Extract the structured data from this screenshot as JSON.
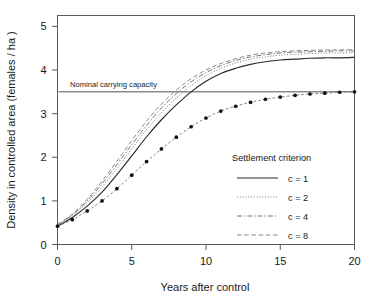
{
  "chart_data": {
    "type": "line",
    "title": "",
    "xlabel": "Years after control",
    "ylabel": "Density in controlled area  (females / ha )",
    "xlim": [
      0,
      20
    ],
    "ylim": [
      0,
      5.25
    ],
    "xticks": [
      0,
      5,
      10,
      15,
      20
    ],
    "xticklabels": [
      "0",
      "5",
      "10",
      "15",
      "20"
    ],
    "yticks": [
      0,
      1,
      2,
      3,
      4,
      5
    ],
    "yticklabels": [
      "0",
      "1",
      "2",
      "3",
      "4",
      "5"
    ],
    "grid": false,
    "legend_position": "lower right",
    "annotations": [
      {
        "name": "nominal-carrying-capacity",
        "text": "Nominal carrying capacity",
        "y_value": 3.5,
        "kind": "horizontal-reference-line"
      }
    ],
    "x": [
      0,
      1,
      2,
      3,
      4,
      5,
      6,
      7,
      8,
      9,
      10,
      11,
      12,
      13,
      14,
      15,
      16,
      17,
      18,
      19,
      20
    ],
    "series": [
      {
        "name": "c = 1",
        "style": "solid",
        "values": [
          0.42,
          0.62,
          0.88,
          1.2,
          1.6,
          2.03,
          2.47,
          2.86,
          3.2,
          3.5,
          3.74,
          3.92,
          4.04,
          4.13,
          4.19,
          4.23,
          4.25,
          4.27,
          4.28,
          4.28,
          4.29
        ]
      },
      {
        "name": "c = 2",
        "style": "dotted",
        "values": [
          0.44,
          0.66,
          0.96,
          1.32,
          1.74,
          2.19,
          2.63,
          3.02,
          3.36,
          3.64,
          3.87,
          4.04,
          4.16,
          4.25,
          4.3,
          4.34,
          4.36,
          4.38,
          4.39,
          4.39,
          4.4
        ]
      },
      {
        "name": "c = 4",
        "style": "dashdot",
        "values": [
          0.45,
          0.68,
          1.0,
          1.39,
          1.83,
          2.29,
          2.73,
          3.13,
          3.46,
          3.73,
          3.94,
          4.1,
          4.22,
          4.3,
          4.35,
          4.39,
          4.41,
          4.42,
          4.43,
          4.44,
          4.44
        ]
      },
      {
        "name": "c = 8",
        "style": "dashed",
        "values": [
          0.46,
          0.7,
          1.04,
          1.45,
          1.91,
          2.38,
          2.83,
          3.22,
          3.54,
          3.8,
          4.0,
          4.15,
          4.26,
          4.34,
          4.39,
          4.42,
          4.44,
          4.45,
          4.46,
          4.46,
          4.47
        ]
      },
      {
        "name": "observed-points",
        "style": "points-dashed",
        "values": [
          0.42,
          0.57,
          0.77,
          1.0,
          1.28,
          1.59,
          1.9,
          2.19,
          2.46,
          2.7,
          2.9,
          3.06,
          3.17,
          3.26,
          3.33,
          3.38,
          3.42,
          3.45,
          3.47,
          3.49,
          3.5
        ]
      }
    ]
  },
  "legend": {
    "title": "Settlement criterion",
    "entries": [
      {
        "label": "c = 1",
        "style": "solid"
      },
      {
        "label": "c = 2",
        "style": "dotted"
      },
      {
        "label": "c = 4",
        "style": "dashdot"
      },
      {
        "label": "c = 8",
        "style": "dashed"
      }
    ]
  }
}
